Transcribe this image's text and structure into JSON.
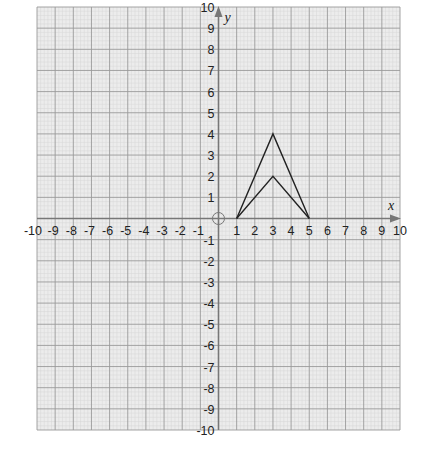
{
  "chart_data": {
    "type": "line",
    "title": "",
    "xlabel": "x",
    "ylabel": "y",
    "xlim": [
      -10,
      10
    ],
    "ylim": [
      -10,
      10
    ],
    "grid": true,
    "x_tick_labels": [
      "-10",
      "-9",
      "-8",
      "-7",
      "-6",
      "-5",
      "-4",
      "-3",
      "-2",
      "-1",
      "1",
      "2",
      "3",
      "4",
      "5",
      "6",
      "7",
      "8",
      "9",
      "10"
    ],
    "y_tick_labels": [
      "10",
      "9",
      "8",
      "7",
      "6",
      "5",
      "4",
      "3",
      "2",
      "1",
      "-1",
      "-2",
      "-3",
      "-4",
      "-5",
      "-6",
      "-7",
      "-8",
      "-9",
      "-10"
    ],
    "series": [
      {
        "name": "outer-path",
        "points": [
          [
            1,
            0
          ],
          [
            3,
            4
          ],
          [
            5,
            0
          ]
        ]
      },
      {
        "name": "inner-path",
        "points": [
          [
            1,
            0
          ],
          [
            3,
            2
          ],
          [
            5,
            0
          ]
        ]
      }
    ],
    "origin_marker": "circle",
    "colors": {
      "grid_bg": "#ececec",
      "major_grid": "#9a9a9a",
      "minor_grid": "#d6d6d6",
      "axis": "#777777",
      "shape": "#222222"
    }
  }
}
